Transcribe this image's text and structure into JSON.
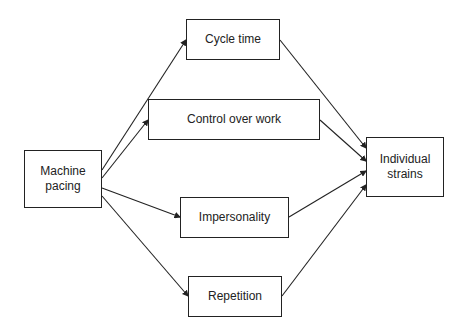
{
  "diagram": {
    "nodes": [
      {
        "id": "machine_pacing",
        "label": "Machine\npacing"
      },
      {
        "id": "cycle_time",
        "label": "Cycle time"
      },
      {
        "id": "control_over_work",
        "label": "Control over work"
      },
      {
        "id": "impersonality",
        "label": "Impersonality"
      },
      {
        "id": "repetition",
        "label": "Repetition"
      },
      {
        "id": "individual_strains",
        "label": "Individual\nstrains"
      }
    ],
    "edges": [
      {
        "from": "machine_pacing",
        "to": "cycle_time"
      },
      {
        "from": "machine_pacing",
        "to": "control_over_work"
      },
      {
        "from": "machine_pacing",
        "to": "impersonality"
      },
      {
        "from": "machine_pacing",
        "to": "repetition"
      },
      {
        "from": "cycle_time",
        "to": "individual_strains"
      },
      {
        "from": "control_over_work",
        "to": "individual_strains"
      },
      {
        "from": "impersonality",
        "to": "individual_strains"
      },
      {
        "from": "repetition",
        "to": "individual_strains"
      }
    ]
  }
}
